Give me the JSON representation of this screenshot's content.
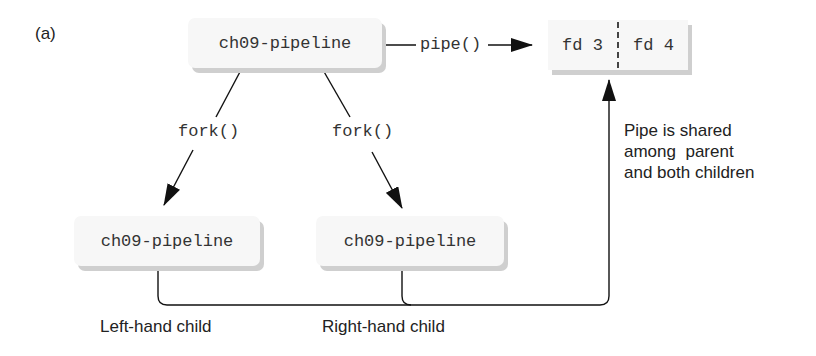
{
  "figure": {
    "panel_label": "(a)",
    "nodes": {
      "parent": "ch09-pipeline",
      "left_child": "ch09-pipeline",
      "right_child": "ch09-pipeline"
    },
    "edges": {
      "pipe_call": "pipe()",
      "fork_left": "fork()",
      "fork_right": "fork()"
    },
    "pipe_fds": [
      "fd 3",
      "fd 4"
    ],
    "annotation": [
      "Pipe is shared",
      "among  parent",
      "and both children"
    ],
    "child_labels": {
      "left": "Left-hand child",
      "right": "Right-hand child"
    },
    "colors": {
      "box_fill": "#f7f7f7",
      "box_shadow": "#cfcfcf",
      "line": "#111111"
    }
  }
}
